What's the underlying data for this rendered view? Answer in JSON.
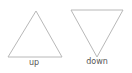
{
  "diagram": {
    "shapes": [
      {
        "id": "up",
        "type": "triangle",
        "direction": "up",
        "label": "up",
        "points": [
          [
            36,
            11
          ],
          [
            8,
            57
          ],
          [
            62,
            57
          ]
        ]
      },
      {
        "id": "down",
        "type": "triangle",
        "direction": "down",
        "label": "down",
        "points": [
          [
            71,
            10
          ],
          [
            123,
            10
          ],
          [
            97,
            57
          ]
        ]
      }
    ],
    "stroke_color": "#b8b8b8",
    "label_color": "#555555",
    "background": "#ffffff"
  }
}
